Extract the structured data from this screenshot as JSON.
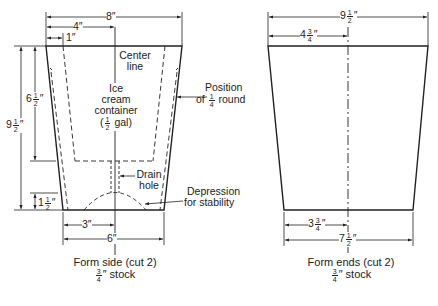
{
  "figure": {
    "side_form": {
      "caption": "Form side (cut 2)",
      "stock_fraction": {
        "num": "3",
        "den": "4"
      },
      "stock_suffix": "″ stock",
      "dimensions": {
        "top_width": "8″",
        "half_top_width": "4″",
        "taper_offset": "1″",
        "total_height_whole": "9",
        "total_height_frac": {
          "num": "1",
          "den": "2"
        },
        "container_depth_whole": "6",
        "container_depth_frac": {
          "num": "1",
          "den": "2"
        },
        "base_height_whole": "1",
        "base_height_frac": {
          "num": "1",
          "den": "2"
        },
        "half_bottom_width": "3″",
        "bottom_width": "6″"
      },
      "annotations": {
        "center_line": [
          "Center",
          "line"
        ],
        "container": [
          "Ice",
          "cream",
          "container"
        ],
        "container_size_frac": {
          "num": "1",
          "den": "2"
        },
        "container_size_suffix": "gal)",
        "container_size_prefix": "(",
        "round_position": [
          "Position",
          "of"
        ],
        "round_frac": {
          "num": "1",
          "den": "4"
        },
        "round_suffix": "round",
        "drain_hole": [
          "Drain",
          "hole"
        ],
        "depression": [
          "Depression",
          "for stability"
        ]
      }
    },
    "end_form": {
      "caption": "Form ends (cut 2)",
      "stock_fraction": {
        "num": "3",
        "den": "4"
      },
      "stock_suffix": "″ stock",
      "dimensions": {
        "top_width_whole": "9",
        "top_width_frac": {
          "num": "1",
          "den": "2"
        },
        "half_top_width_whole": "4",
        "half_top_width_frac": {
          "num": "3",
          "den": "4"
        },
        "half_bottom_width_whole": "3",
        "half_bottom_width_frac": {
          "num": "3",
          "den": "4"
        },
        "bottom_width_whole": "7",
        "bottom_width_frac": {
          "num": "1",
          "den": "2"
        }
      }
    }
  }
}
